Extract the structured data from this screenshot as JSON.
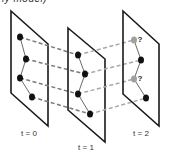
{
  "caption_fragment": "ly model)",
  "frames": [
    {
      "label": "t = 0",
      "plane": {
        "tl": [
          11,
          11
        ],
        "tr": [
          48,
          44
        ],
        "br": [
          48,
          126
        ],
        "bl": [
          11,
          93
        ]
      },
      "label_pos": [
        29,
        136
      ],
      "points": [
        {
          "x": 20,
          "y": 37,
          "status": "known"
        },
        {
          "x": 26,
          "y": 59,
          "status": "known"
        },
        {
          "x": 20,
          "y": 78,
          "status": "known"
        },
        {
          "x": 32,
          "y": 97,
          "status": "known"
        }
      ]
    },
    {
      "label": "t = 1",
      "plane": {
        "tl": [
          68,
          28
        ],
        "tr": [
          105,
          59
        ],
        "br": [
          105,
          142
        ],
        "bl": [
          68,
          110
        ]
      },
      "label_pos": [
        86,
        150
      ],
      "points": [
        {
          "x": 78,
          "y": 55,
          "status": "known"
        },
        {
          "x": 85,
          "y": 74,
          "status": "known"
        },
        {
          "x": 78,
          "y": 94,
          "status": "known"
        },
        {
          "x": 90,
          "y": 114,
          "status": "known"
        }
      ]
    },
    {
      "label": "t = 2",
      "plane": {
        "tl": [
          123,
          11
        ],
        "tr": [
          159,
          44
        ],
        "br": [
          159,
          126
        ],
        "bl": [
          123,
          94
        ]
      },
      "label_pos": [
        141,
        136
      ],
      "points": [
        {
          "x": 134,
          "y": 40,
          "status": "unknown",
          "marker": "?"
        },
        {
          "x": 141,
          "y": 60,
          "status": "known"
        },
        {
          "x": 134,
          "y": 79,
          "status": "unknown",
          "marker": "?"
        },
        {
          "x": 146,
          "y": 98,
          "status": "known"
        }
      ]
    }
  ],
  "colors": {
    "plane_border": "#1a1a1a",
    "known_point": "#111111",
    "unknown_point": "#a0a0a0",
    "link_t0_t1": "#7a7a7a",
    "link_t1_t2": "#a8a8a8"
  }
}
